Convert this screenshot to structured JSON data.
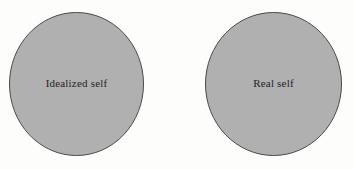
{
  "diagram": {
    "type": "two-circle-concept-diagram",
    "background_color": "#fdfdfc",
    "shape_fill_color": "#b0b0b0",
    "shape_stroke_color": "#4a4a4a",
    "label_text_color": "#242424",
    "shapes": [
      {
        "id": "idealized-self",
        "label": "Idealized self",
        "shape": "ellipse",
        "center_x": 76.5,
        "center_y": 84,
        "radius_x": 67.5,
        "radius_y": 72
      },
      {
        "id": "real-self",
        "label": "Real self",
        "shape": "ellipse",
        "center_x": 273.5,
        "center_y": 84,
        "radius_x": 68.5,
        "radius_y": 72
      }
    ]
  }
}
